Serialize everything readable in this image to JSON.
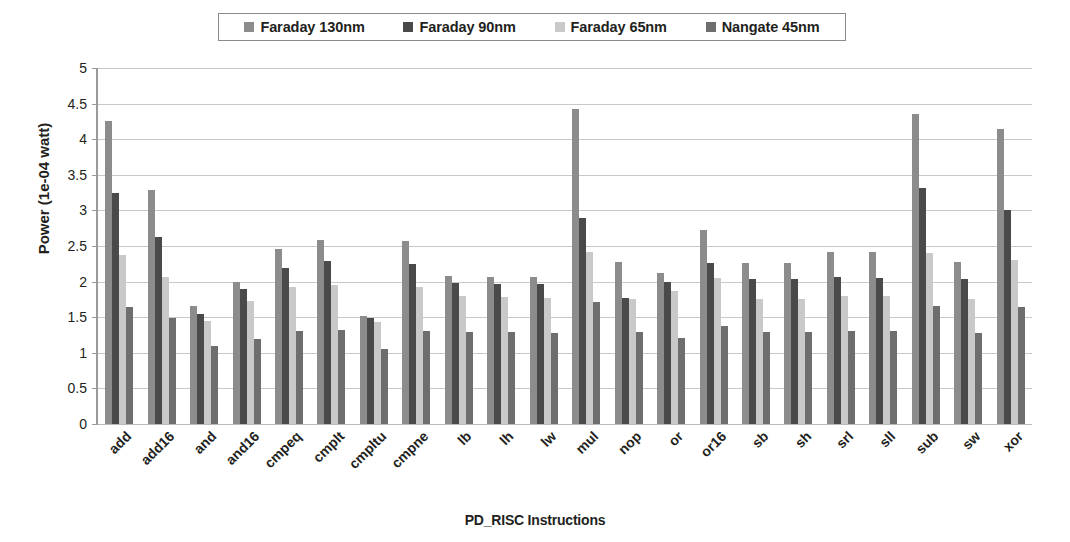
{
  "chart_data": {
    "type": "bar",
    "title": "",
    "xlabel": "PD_RISC Instructions",
    "ylabel": "Power (1e-04 watt)",
    "ylim": [
      0,
      5
    ],
    "ytick_step": 0.5,
    "yticks": [
      "0",
      "0.5",
      "1",
      "1.5",
      "2",
      "2.5",
      "3",
      "3.5",
      "4",
      "4.5",
      "5"
    ],
    "grid": true,
    "legend_position": "top-center",
    "categories": [
      "add",
      "add16",
      "and",
      "and16",
      "cmpeq",
      "cmplt",
      "cmpltu",
      "cmpne",
      "lb",
      "lh",
      "lw",
      "mul",
      "nop",
      "or",
      "or16",
      "sb",
      "sh",
      "srl",
      "sll",
      "sub",
      "sw",
      "xor"
    ],
    "series": [
      {
        "name": "Faraday 130nm",
        "color": "#8c8c8c",
        "values": [
          4.25,
          3.29,
          1.66,
          2.0,
          2.46,
          2.59,
          1.52,
          2.57,
          2.08,
          2.07,
          2.07,
          4.43,
          2.27,
          2.12,
          2.72,
          2.26,
          2.26,
          2.41,
          2.41,
          4.36,
          2.28,
          4.15
        ]
      },
      {
        "name": "Faraday 90nm",
        "color": "#4a4a4a",
        "values": [
          3.25,
          2.62,
          1.55,
          1.89,
          2.19,
          2.29,
          1.49,
          2.25,
          1.98,
          1.97,
          1.96,
          2.9,
          1.77,
          1.99,
          2.26,
          2.04,
          2.03,
          2.06,
          2.05,
          3.31,
          2.03,
          3.01
        ]
      },
      {
        "name": "Faraday 65nm",
        "color": "#c9c9c9",
        "values": [
          2.38,
          2.07,
          1.44,
          1.73,
          1.93,
          1.95,
          1.43,
          1.93,
          1.8,
          1.78,
          1.77,
          2.42,
          1.75,
          1.87,
          2.05,
          1.76,
          1.76,
          1.8,
          1.8,
          2.4,
          1.76,
          2.3
        ]
      },
      {
        "name": "Nangate 45nm",
        "color": "#6e6e6e",
        "values": [
          1.65,
          1.49,
          1.09,
          1.2,
          1.3,
          1.32,
          1.06,
          1.31,
          1.29,
          1.29,
          1.28,
          1.72,
          1.29,
          1.21,
          1.37,
          1.29,
          1.29,
          1.31,
          1.31,
          1.66,
          1.28,
          1.64
        ]
      }
    ]
  }
}
